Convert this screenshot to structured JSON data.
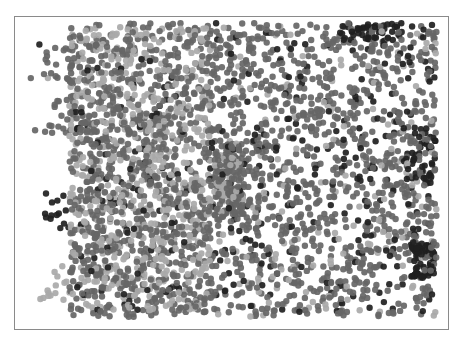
{
  "chart_data": {
    "type": "scatter",
    "title": "",
    "xlabel": "",
    "ylabel": "",
    "xlim": [
      0,
      1
    ],
    "ylim": [
      0,
      1
    ],
    "grid": false,
    "legend": null,
    "axes_visible": false,
    "frame": {
      "visible": true,
      "color": "#8a8a8a"
    },
    "marker": {
      "shape": "circle",
      "radius_px": 3.2,
      "opacity": 0.92
    },
    "coordinate_note": "normalized 0-1 within plot frame, origin bottom-left",
    "series": [
      {
        "name": "light",
        "color": "#a9a9a9"
      },
      {
        "name": "medium",
        "color": "#666666"
      },
      {
        "name": "dark",
        "color": "#1f1f1f"
      }
    ],
    "clusters": [
      {
        "series": "light",
        "x": [
          0.12,
          0.45
        ],
        "y": [
          0.05,
          0.98
        ],
        "n": 620
      },
      {
        "series": "medium",
        "x": [
          0.12,
          0.45
        ],
        "y": [
          0.03,
          0.99
        ],
        "n": 900
      },
      {
        "series": "dark",
        "x": [
          0.13,
          0.4
        ],
        "y": [
          0.05,
          0.95
        ],
        "n": 90
      },
      {
        "series": "light",
        "x": [
          0.45,
          0.98
        ],
        "y": [
          0.03,
          0.98
        ],
        "n": 150
      },
      {
        "series": "medium",
        "x": [
          0.45,
          0.98
        ],
        "y": [
          0.03,
          0.99
        ],
        "n": 1050
      },
      {
        "series": "dark",
        "x": [
          0.45,
          0.98
        ],
        "y": [
          0.03,
          0.99
        ],
        "n": 220
      },
      {
        "series": "dark",
        "x": [
          0.92,
          0.975
        ],
        "y": [
          0.16,
          0.27
        ],
        "n": 70
      },
      {
        "series": "dark",
        "x": [
          0.75,
          0.9
        ],
        "y": [
          0.93,
          0.99
        ],
        "n": 45
      },
      {
        "series": "dark",
        "x": [
          0.9,
          0.98
        ],
        "y": [
          0.45,
          0.65
        ],
        "n": 45
      },
      {
        "series": "medium",
        "x": [
          0.46,
          0.53
        ],
        "y": [
          0.35,
          0.6
        ],
        "n": 120
      },
      {
        "series": "light",
        "x": [
          0.46,
          0.53
        ],
        "y": [
          0.4,
          0.55
        ],
        "n": 40
      },
      {
        "series": "medium",
        "x": [
          0.06,
          0.13
        ],
        "y": [
          0.62,
          0.92
        ],
        "n": 40
      },
      {
        "series": "dark",
        "x": [
          0.06,
          0.12
        ],
        "y": [
          0.3,
          0.45
        ],
        "n": 14
      },
      {
        "series": "light",
        "x": [
          0.05,
          0.12
        ],
        "y": [
          0.08,
          0.2
        ],
        "n": 14
      }
    ],
    "outliers": [
      {
        "series": "medium",
        "x": 0.03,
        "y": 0.81
      },
      {
        "series": "light",
        "x": 0.07,
        "y": 0.81
      },
      {
        "series": "medium",
        "x": 0.04,
        "y": 0.64
      },
      {
        "series": "dark",
        "x": 0.05,
        "y": 0.92
      }
    ],
    "seed": 20240611
  }
}
